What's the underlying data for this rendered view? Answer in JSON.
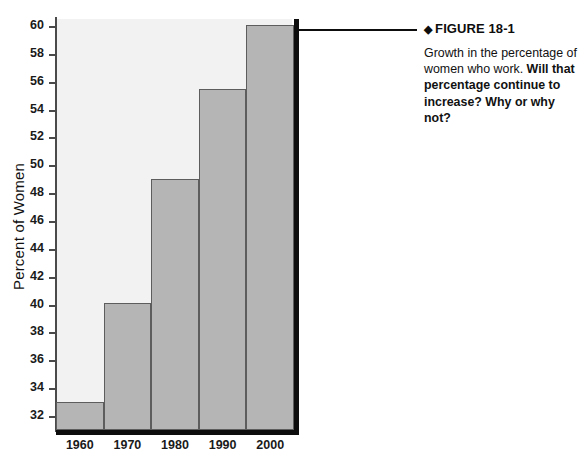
{
  "chart_data": {
    "type": "bar",
    "title": "",
    "xlabel": "",
    "ylabel": "Percent of Women",
    "categories": [
      "1960",
      "1970",
      "1980",
      "1990",
      "2000"
    ],
    "values": [
      33,
      40.1,
      49,
      55.5,
      60.1
    ],
    "ylim": [
      31,
      60.5
    ],
    "yticks": [
      32,
      34,
      36,
      38,
      40,
      42,
      44,
      46,
      48,
      50,
      52,
      54,
      56,
      58,
      60
    ],
    "grid": false,
    "legend": false,
    "bar_fill_color": "#b5b5b5",
    "bar_border_color": "#5d5d5d",
    "plot_background_color": "#f2f2f2",
    "axis_color": "#0d0d0d"
  },
  "caption": {
    "diamond": "◆",
    "heading": "FIGURE 18-1",
    "body_lead": "Growth in the percentage of women who work. ",
    "body_emphasis": "Will that percentage continue to increase? Why or why not?"
  },
  "footer": {
    "clipped_text": ""
  }
}
